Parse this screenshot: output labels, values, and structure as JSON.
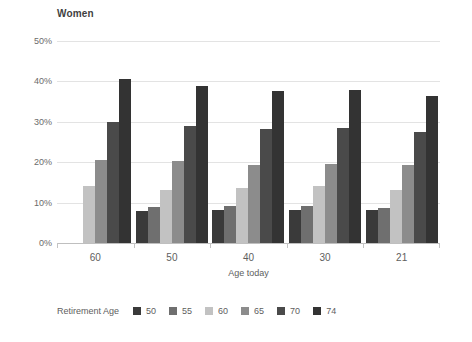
{
  "chart_data": {
    "type": "bar",
    "title": "Women",
    "xlabel": "Age today",
    "ylabel": "",
    "categories": [
      "60",
      "50",
      "40",
      "30",
      "21"
    ],
    "ylim": [
      0,
      50
    ],
    "ytick_values": [
      0,
      10,
      20,
      30,
      40,
      50
    ],
    "ytick_labels": [
      "0%",
      "10%",
      "20%",
      "30%",
      "40%",
      "50%"
    ],
    "grid": true,
    "legend_position": "bottom",
    "legend_title": "Retirement Age",
    "series": [
      {
        "name": "50",
        "color": "#3a3a3a",
        "values": [
          null,
          8.0,
          8.2,
          8.2,
          8.2
        ]
      },
      {
        "name": "55",
        "color": "#6f6f6f",
        "values": [
          null,
          9.0,
          9.2,
          9.2,
          8.6
        ]
      },
      {
        "name": "60",
        "color": "#c2c2c2",
        "values": [
          14.0,
          13.2,
          13.5,
          14.0,
          13.2
        ]
      },
      {
        "name": "65",
        "color": "#8c8c8c",
        "values": [
          20.5,
          20.2,
          19.3,
          19.5,
          19.3
        ]
      },
      {
        "name": "70",
        "color": "#4a4a4a",
        "values": [
          30.0,
          29.0,
          28.2,
          28.4,
          27.4
        ]
      },
      {
        "name": "74",
        "color": "#333333",
        "values": [
          40.5,
          38.8,
          37.7,
          37.8,
          36.5
        ]
      }
    ]
  }
}
